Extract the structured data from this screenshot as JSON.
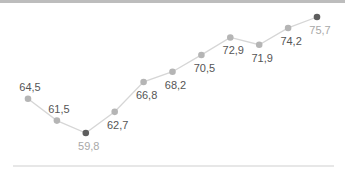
{
  "chart_data": {
    "type": "line",
    "title": "",
    "xlabel": "",
    "ylabel": "",
    "categories": [
      "1",
      "2",
      "3",
      "4",
      "5",
      "6",
      "7",
      "8",
      "9",
      "10",
      "11"
    ],
    "values": [
      64.5,
      61.5,
      59.8,
      62.7,
      66.8,
      68.2,
      70.5,
      72.9,
      71.9,
      74.2,
      75.7
    ],
    "labels": [
      "64,5",
      "61,5",
      "59,8",
      "62,7",
      "66,8",
      "68,2",
      "70,5",
      "72,9",
      "71,9",
      "74,2",
      "75,7"
    ],
    "label_position": [
      "above",
      "above",
      "below",
      "below",
      "below",
      "below",
      "below",
      "below",
      "below",
      "below",
      "below"
    ],
    "highlight": {
      "min_index": 2,
      "max_index": 10
    },
    "ylim": [
      59.8,
      75.7
    ],
    "grid": false,
    "legend": null,
    "colors": {
      "line": "#d6d6d6",
      "point": "#b5b5b5",
      "highlight_point": "#5e5e5e",
      "label": "#555555",
      "highlight_label": "#a8a8a8",
      "baseline": "#cfcfcf",
      "top_bar": "#bdbdbd"
    }
  }
}
